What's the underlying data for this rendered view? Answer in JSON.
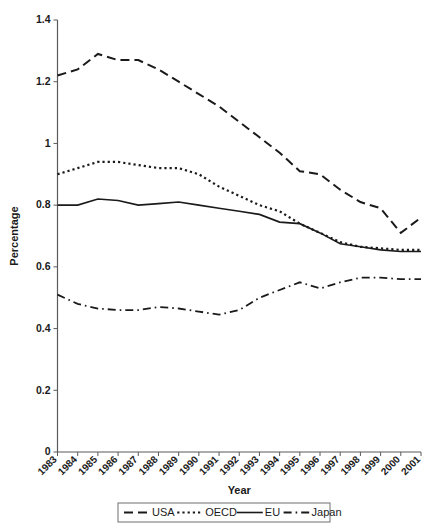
{
  "chart_data": {
    "type": "line",
    "title": "",
    "xlabel": "Year",
    "ylabel": "Percentage",
    "x": [
      1983,
      1984,
      1985,
      1986,
      1987,
      1988,
      1989,
      1990,
      1991,
      1992,
      1993,
      1994,
      1995,
      1996,
      1997,
      1998,
      1999,
      2000,
      2001
    ],
    "categories": [
      "1983",
      "1984",
      "1985",
      "1986",
      "1987",
      "1988",
      "1989",
      "1990",
      "1991",
      "1992",
      "1993",
      "1994",
      "1995",
      "1996",
      "1997",
      "1998",
      "1999",
      "2000",
      "2001"
    ],
    "xlim": [
      1983,
      2001
    ],
    "ylim": [
      0,
      1.4
    ],
    "yticks": [
      0,
      0.2,
      0.4,
      0.6,
      0.8,
      1,
      1.2,
      1.4
    ],
    "ytick_labels": [
      "0",
      "0.2",
      "0.4",
      "0.6",
      "0.8",
      "1",
      "1.2",
      "1.4"
    ],
    "grid": false,
    "legend_position": "bottom",
    "series": [
      {
        "name": "USA",
        "style": "dashed",
        "color": "#1a1a1a",
        "values": [
          1.22,
          1.24,
          1.29,
          1.27,
          1.27,
          1.24,
          1.2,
          1.16,
          1.12,
          1.07,
          1.02,
          0.97,
          0.91,
          0.9,
          0.85,
          0.81,
          0.79,
          0.71,
          0.76
        ]
      },
      {
        "name": "OECD",
        "style": "dotted",
        "color": "#1a1a1a",
        "values": [
          0.9,
          0.92,
          0.94,
          0.94,
          0.93,
          0.92,
          0.92,
          0.9,
          0.86,
          0.83,
          0.8,
          0.78,
          0.74,
          0.71,
          0.68,
          0.665,
          0.66,
          0.655,
          0.655
        ]
      },
      {
        "name": "EU",
        "style": "solid",
        "color": "#1a1a1a",
        "values": [
          0.8,
          0.8,
          0.82,
          0.815,
          0.8,
          0.805,
          0.81,
          0.8,
          0.79,
          0.78,
          0.77,
          0.745,
          0.74,
          0.71,
          0.675,
          0.665,
          0.655,
          0.65,
          0.65
        ]
      },
      {
        "name": "Japan",
        "style": "dashdot",
        "color": "#1a1a1a",
        "values": [
          0.51,
          0.48,
          0.465,
          0.46,
          0.46,
          0.47,
          0.465,
          0.455,
          0.445,
          0.46,
          0.5,
          0.525,
          0.55,
          0.53,
          0.55,
          0.565,
          0.565,
          0.56,
          0.56
        ]
      }
    ]
  },
  "legend": {
    "entries": [
      {
        "label": "USA",
        "style": "dashed"
      },
      {
        "label": "OECD",
        "style": "dotted"
      },
      {
        "label": "EU",
        "style": "solid"
      },
      {
        "label": "Japan",
        "style": "dashdot"
      }
    ]
  }
}
